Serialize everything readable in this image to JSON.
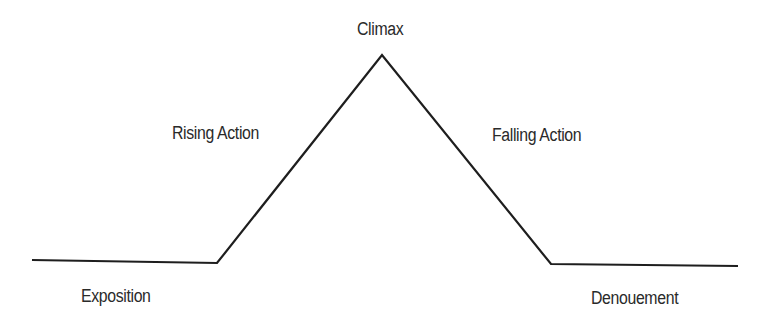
{
  "diagram": {
    "line_color": "#1e1e1e",
    "text_color": "#2a2a2a",
    "points": [
      {
        "x": 32,
        "y": 260
      },
      {
        "x": 217,
        "y": 263
      },
      {
        "x": 382,
        "y": 55
      },
      {
        "x": 551,
        "y": 264
      },
      {
        "x": 738,
        "y": 266
      }
    ],
    "labels": {
      "exposition": "Exposition",
      "rising_action": "Rising Action",
      "climax": "Climax",
      "falling_action": "Falling Action",
      "denouement": "Denouement"
    }
  }
}
